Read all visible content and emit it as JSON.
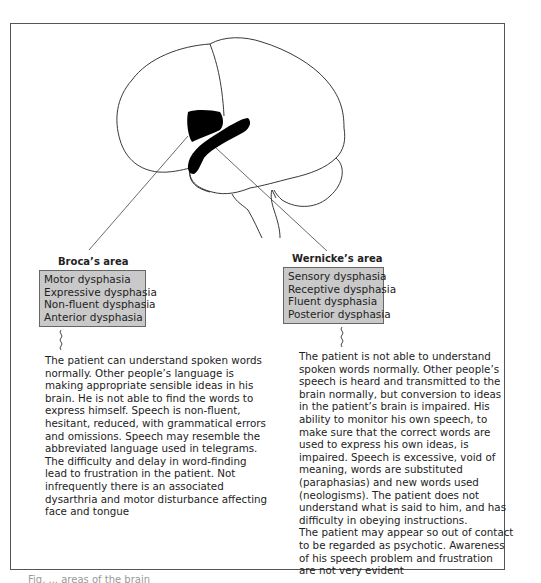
{
  "figure": {
    "broca": {
      "title": "Broca’s area",
      "synonyms": [
        "Motor dysphasia",
        "Expressive dysphasia",
        "Non-fluent dysphasia",
        "Anterior dysphasia"
      ],
      "description_lines": [
        "The patient can understand spoken words",
        "normally. Other people’s language is",
        "making appropriate sensible ideas in his",
        "brain. He is not able to find the words to",
        "express himself. Speech is non-fluent,",
        "hesitant, reduced, with grammatical errors",
        "and omissions. Speech may resemble the",
        "abbreviated language used in telegrams.",
        "The difficulty and delay in word-finding",
        "lead to frustration in the patient. Not",
        "infrequently there is an associated",
        "dysarthria and motor disturbance affecting",
        "face and tongue"
      ]
    },
    "wernicke": {
      "title": "Wernicke’s area",
      "synonyms": [
        "Sensory dysphasia",
        "Receptive dysphasia",
        "Fluent dysphasia",
        "Posterior dysphasia"
      ],
      "description_lines": [
        "The patient is not able to understand",
        "spoken words normally. Other people’s",
        "speech is heard and transmitted to the",
        "brain normally, but conversion to ideas",
        "in the patient’s brain is impaired. His",
        "ability to monitor his own speech, to",
        "make sure that the correct words are",
        "used to express his own ideas, is",
        "impaired. Speech is excessive, void of",
        "meaning, words are substituted",
        "(paraphasias) and new words used",
        "(neologisms). The patient does not",
        "understand what is said to him, and has",
        "difficulty in obeying instructions.",
        "The patient may appear so out of contact",
        "to be regarded as psychotic. Awareness",
        "of his speech problem and frustration",
        "are not very evident"
      ]
    },
    "caption_partial": "Fig. ... areas of the brain"
  },
  "colors": {
    "box_fill": "#c9c9c9",
    "region_fill": "#000000",
    "line": "#222222"
  }
}
